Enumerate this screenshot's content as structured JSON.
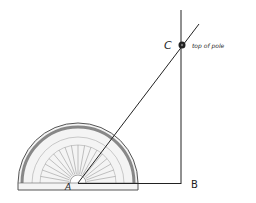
{
  "diagram": {
    "title": "",
    "points": {
      "A": {
        "label": "A"
      },
      "B": {
        "label": "B"
      },
      "C": {
        "label": "C",
        "annotation": "top of pole"
      }
    },
    "protractor": {
      "outer_scale": [
        "0",
        "10",
        "20",
        "30",
        "40",
        "50",
        "60",
        "70",
        "80",
        "90",
        "100",
        "110",
        "120",
        "130",
        "140",
        "150",
        "160",
        "170",
        "180"
      ],
      "inner_scale": [
        "180",
        "170",
        "160",
        "150",
        "140",
        "130",
        "120",
        "110",
        "100",
        "90",
        "80",
        "70",
        "60",
        "50",
        "40",
        "30",
        "20",
        "10",
        "0"
      ]
    },
    "colors": {
      "line": "#222222",
      "protractor_edge": "#555555",
      "background": "#ffffff"
    }
  }
}
